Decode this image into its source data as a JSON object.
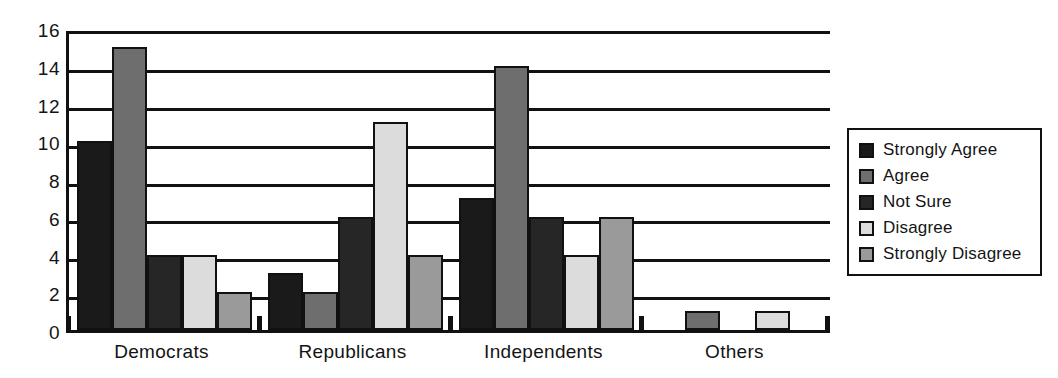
{
  "chart_data": {
    "type": "bar",
    "title": "",
    "subtitle": "",
    "xlabel": "",
    "ylabel": "",
    "grid": true,
    "legend_position": "right",
    "ylim": [
      0,
      16
    ],
    "ytick_step": 2,
    "yticks": [
      "16",
      "14",
      "12",
      "10",
      "8",
      "6",
      "4",
      "2",
      "0"
    ],
    "categories": [
      "Democrats",
      "Republicans",
      "Independents",
      "Others"
    ],
    "series": [
      {
        "name": "Strongly Agree",
        "color": "#1a1a1a",
        "values": [
          10,
          3,
          7,
          0
        ]
      },
      {
        "name": "Agree",
        "color": "#6e6e6e",
        "values": [
          15,
          2,
          14,
          1
        ]
      },
      {
        "name": "Not Sure",
        "color": "#262626",
        "values": [
          4,
          6,
          6,
          0
        ]
      },
      {
        "name": "Disagree",
        "color": "#dcdcdc",
        "values": [
          4,
          11,
          4,
          1
        ]
      },
      {
        "name": "Strongly Disagree",
        "color": "#9a9a9a",
        "values": [
          2,
          4,
          6,
          0
        ]
      }
    ]
  },
  "legend": {
    "items": [
      {
        "label": "Strongly Agree"
      },
      {
        "label": "Agree"
      },
      {
        "label": "Not Sure"
      },
      {
        "label": "Disagree"
      },
      {
        "label": "Strongly Disagree"
      }
    ]
  },
  "axes": {
    "y_values": [
      16,
      14,
      12,
      10,
      8,
      6,
      4,
      2,
      0
    ],
    "x_values": [
      "Democrats",
      "Republicans",
      "Independents",
      "Others"
    ]
  }
}
